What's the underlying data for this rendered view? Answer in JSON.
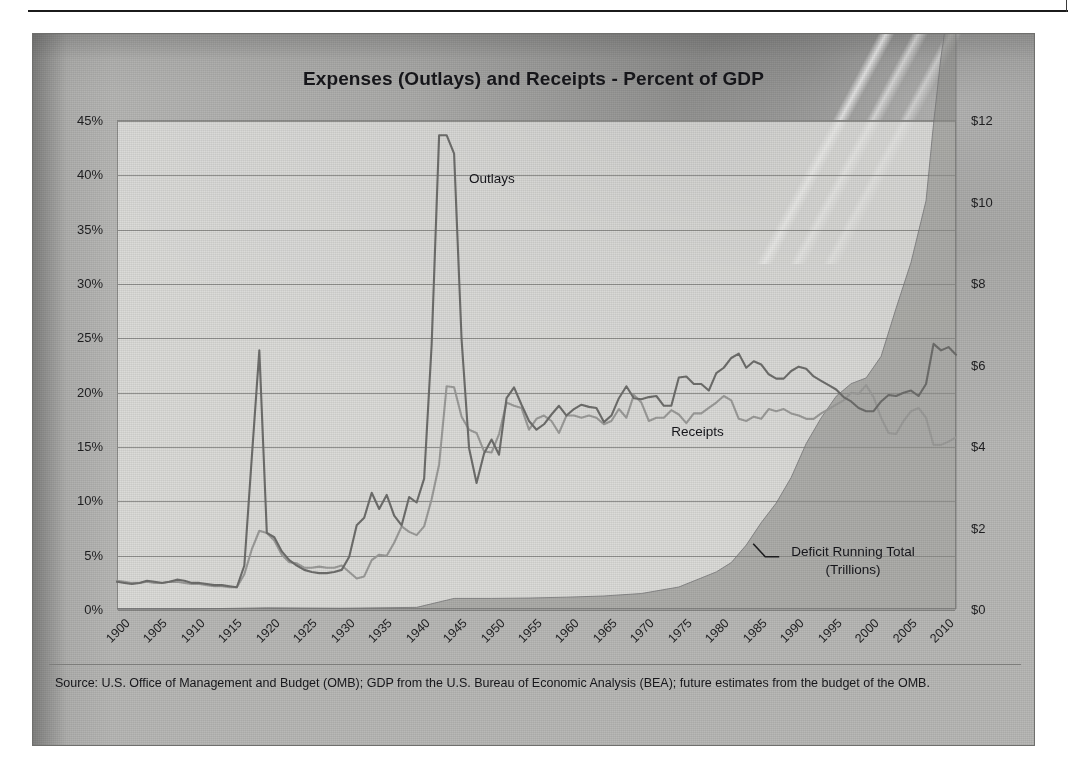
{
  "page": {
    "rule_present": true
  },
  "chart_data": {
    "type": "line",
    "title": "Expenses (Outlays) and Receipts - Percent of GDP",
    "xlabel": "",
    "ylabel": "",
    "y2label": "",
    "xlim": [
      1900,
      2012
    ],
    "ylim": [
      0,
      45
    ],
    "y2lim": [
      0,
      12
    ],
    "grid": true,
    "legend_position": "inline-annotations",
    "yticks": [
      "0%",
      "5%",
      "10%",
      "15%",
      "20%",
      "25%",
      "30%",
      "35%",
      "40%",
      "45%"
    ],
    "ytick_values": [
      0,
      5,
      10,
      15,
      20,
      25,
      30,
      35,
      40,
      45
    ],
    "y2ticks": [
      "$0",
      "$2",
      "$4",
      "$6",
      "$8",
      "$10",
      "$12"
    ],
    "y2tick_values": [
      0,
      2,
      4,
      6,
      8,
      10,
      12
    ],
    "xticks": [
      "1900",
      "1905",
      "1910",
      "1915",
      "1920",
      "1925",
      "1930",
      "1935",
      "1940",
      "1945",
      "1950",
      "1955",
      "1960",
      "1965",
      "1970",
      "1975",
      "1980",
      "1985",
      "1990",
      "1995",
      "2000",
      "2005",
      "2010"
    ],
    "xtick_values": [
      1900,
      1905,
      1910,
      1915,
      1920,
      1925,
      1930,
      1935,
      1940,
      1945,
      1950,
      1955,
      1960,
      1965,
      1970,
      1975,
      1980,
      1985,
      1990,
      1995,
      2000,
      2005,
      2010
    ],
    "annotations": [
      {
        "name": "outlays",
        "text": "Outlays",
        "x": 1947,
        "y": 39.5
      },
      {
        "name": "receipts",
        "text": "Receipts",
        "x": 1974,
        "y": 16.2
      },
      {
        "name": "deficit",
        "text": "Deficit Running Total",
        "text2": "(Trillions)",
        "x": 1990,
        "y": 5.0,
        "leader": true
      }
    ],
    "series": [
      {
        "name": "Outlays",
        "unit": "percent-of-gdp",
        "axis": "left",
        "color": "#7a7a78",
        "x": [
          1900,
          1901,
          1902,
          1903,
          1904,
          1905,
          1906,
          1907,
          1908,
          1909,
          1910,
          1911,
          1912,
          1913,
          1914,
          1915,
          1916,
          1917,
          1918,
          1919,
          1920,
          1921,
          1922,
          1923,
          1924,
          1925,
          1926,
          1927,
          1928,
          1929,
          1930,
          1931,
          1932,
          1933,
          1934,
          1935,
          1936,
          1937,
          1938,
          1939,
          1940,
          1941,
          1942,
          1943,
          1944,
          1945,
          1946,
          1947,
          1948,
          1949,
          1950,
          1951,
          1952,
          1953,
          1954,
          1955,
          1956,
          1957,
          1958,
          1959,
          1960,
          1961,
          1962,
          1963,
          1964,
          1965,
          1966,
          1967,
          1968,
          1969,
          1970,
          1971,
          1972,
          1973,
          1974,
          1975,
          1976,
          1977,
          1978,
          1979,
          1980,
          1981,
          1982,
          1983,
          1984,
          1985,
          1986,
          1987,
          1988,
          1989,
          1990,
          1991,
          1992,
          1993,
          1994,
          1995,
          1996,
          1997,
          1998,
          1999,
          2000,
          2001,
          2002,
          2003,
          2004,
          2005,
          2006,
          2007,
          2008,
          2009,
          2010,
          2011,
          2012
        ],
        "values": [
          2.5,
          2.4,
          2.3,
          2.4,
          2.6,
          2.5,
          2.4,
          2.5,
          2.7,
          2.6,
          2.4,
          2.4,
          2.3,
          2.2,
          2.2,
          2.1,
          2.0,
          4.0,
          14.0,
          23.8,
          7.0,
          6.6,
          5.3,
          4.5,
          4.0,
          3.6,
          3.4,
          3.3,
          3.3,
          3.4,
          3.6,
          4.8,
          7.7,
          8.4,
          10.7,
          9.2,
          10.5,
          8.6,
          7.7,
          10.3,
          9.8,
          12.0,
          24.3,
          43.6,
          43.6,
          41.9,
          24.8,
          14.8,
          11.6,
          14.3,
          15.6,
          14.2,
          19.4,
          20.4,
          18.8,
          17.3,
          16.5,
          17.0,
          17.9,
          18.7,
          17.8,
          18.4,
          18.8,
          18.6,
          18.5,
          17.2,
          17.8,
          19.4,
          20.5,
          19.4,
          19.3,
          19.5,
          19.6,
          18.7,
          18.7,
          21.3,
          21.4,
          20.7,
          20.7,
          20.1,
          21.7,
          22.2,
          23.1,
          23.5,
          22.2,
          22.8,
          22.5,
          21.6,
          21.2,
          21.2,
          21.9,
          22.3,
          22.1,
          21.4,
          21.0,
          20.6,
          20.2,
          19.5,
          19.1,
          18.5,
          18.2,
          18.2,
          19.1,
          19.7,
          19.6,
          19.9,
          20.1,
          19.6,
          20.7,
          24.4,
          23.8,
          24.1,
          23.4
        ]
      },
      {
        "name": "Receipts",
        "unit": "percent-of-gdp",
        "axis": "left",
        "color": "#a0a09e",
        "x": [
          1900,
          1901,
          1902,
          1903,
          1904,
          1905,
          1906,
          1907,
          1908,
          1909,
          1910,
          1911,
          1912,
          1913,
          1914,
          1915,
          1916,
          1917,
          1918,
          1919,
          1920,
          1921,
          1922,
          1923,
          1924,
          1925,
          1926,
          1927,
          1928,
          1929,
          1930,
          1931,
          1932,
          1933,
          1934,
          1935,
          1936,
          1937,
          1938,
          1939,
          1940,
          1941,
          1942,
          1943,
          1944,
          1945,
          1946,
          1947,
          1948,
          1949,
          1950,
          1951,
          1952,
          1953,
          1954,
          1955,
          1956,
          1957,
          1958,
          1959,
          1960,
          1961,
          1962,
          1963,
          1964,
          1965,
          1966,
          1967,
          1968,
          1969,
          1970,
          1971,
          1972,
          1973,
          1974,
          1975,
          1976,
          1977,
          1978,
          1979,
          1980,
          1981,
          1982,
          1983,
          1984,
          1985,
          1986,
          1987,
          1988,
          1989,
          1990,
          1991,
          1992,
          1993,
          1994,
          1995,
          1996,
          1997,
          1998,
          1999,
          2000,
          2001,
          2002,
          2003,
          2004,
          2005,
          2006,
          2007,
          2008,
          2009,
          2010,
          2011,
          2012
        ],
        "values": [
          2.6,
          2.5,
          2.4,
          2.4,
          2.5,
          2.4,
          2.4,
          2.5,
          2.5,
          2.4,
          2.3,
          2.3,
          2.2,
          2.1,
          2.1,
          2.0,
          2.0,
          3.2,
          5.5,
          7.2,
          7.0,
          6.3,
          5.0,
          4.3,
          4.2,
          3.8,
          3.8,
          3.9,
          3.8,
          3.8,
          4.0,
          3.4,
          2.8,
          3.0,
          4.5,
          5.0,
          4.9,
          6.1,
          7.6,
          7.1,
          6.8,
          7.6,
          10.1,
          13.3,
          20.5,
          20.4,
          17.7,
          16.5,
          16.2,
          14.5,
          14.4,
          16.1,
          19.0,
          18.7,
          18.5,
          16.5,
          17.5,
          17.8,
          17.3,
          16.2,
          17.8,
          17.8,
          17.6,
          17.8,
          17.6,
          17.0,
          17.3,
          18.4,
          17.6,
          19.7,
          19.0,
          17.3,
          17.6,
          17.6,
          18.3,
          17.9,
          17.1,
          18.0,
          18.0,
          18.5,
          19.0,
          19.6,
          19.2,
          17.5,
          17.3,
          17.7,
          17.5,
          18.4,
          18.2,
          18.4,
          18.0,
          17.8,
          17.5,
          17.5,
          18.0,
          18.4,
          18.8,
          19.2,
          19.9,
          19.8,
          20.6,
          19.5,
          17.6,
          16.2,
          16.1,
          17.3,
          18.2,
          18.5,
          17.6,
          15.1,
          15.1,
          15.4,
          15.8
        ]
      },
      {
        "name": "Deficit Running Total",
        "unit": "trillions-usd",
        "axis": "right",
        "color": "#8f8f8d",
        "fill": true,
        "x": [
          1900,
          1910,
          1920,
          1930,
          1940,
          1945,
          1950,
          1955,
          1960,
          1965,
          1970,
          1975,
          1980,
          1982,
          1984,
          1986,
          1988,
          1990,
          1992,
          1994,
          1996,
          1998,
          2000,
          2002,
          2004,
          2006,
          2008,
          2009,
          2010,
          2011,
          2012
        ],
        "values": [
          0.0,
          0.0,
          0.03,
          0.02,
          0.04,
          0.26,
          0.26,
          0.27,
          0.29,
          0.32,
          0.38,
          0.54,
          0.91,
          1.14,
          1.57,
          2.12,
          2.6,
          3.23,
          4.06,
          4.69,
          5.22,
          5.53,
          5.67,
          6.2,
          7.38,
          8.51,
          10.02,
          11.91,
          13.56,
          14.79,
          16.06
        ]
      }
    ]
  },
  "source": {
    "text": "Source: U.S. Office of Management and Budget (OMB); GDP from the U.S. Bureau of Economic Analysis (BEA); future estimates from the budget of the OMB."
  }
}
